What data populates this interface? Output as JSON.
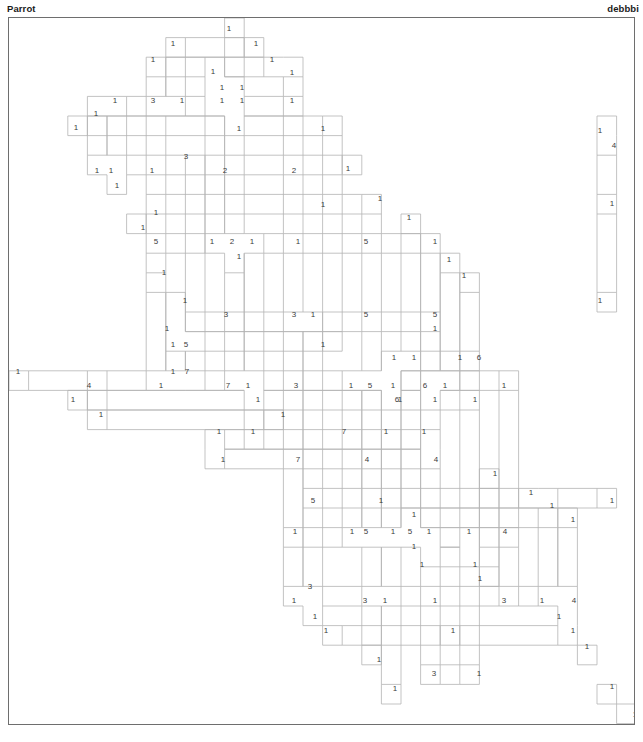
{
  "header": {
    "title": "Parrot",
    "author": "debbbi"
  },
  "footer": {
    "text": ""
  },
  "grid": {
    "cell_size": 19.6,
    "origin_x": 0.5,
    "origin_y": 0.5,
    "cols": 32,
    "rows": 36,
    "border_color": "#6e6e6e",
    "region_color": "#b4b4b4",
    "number_color": "#3c3c3c",
    "background": "#ffffff"
  },
  "chart_data": {
    "type": "table",
    "title": "Parrot",
    "xlabel": "",
    "ylabel": "",
    "clues": [
      {
        "n": "1",
        "x": 228,
        "y": 28
      },
      {
        "n": "1",
        "x": 172,
        "y": 43
      },
      {
        "n": "1",
        "x": 255,
        "y": 43
      },
      {
        "n": "1",
        "x": 152,
        "y": 59
      },
      {
        "n": "1",
        "x": 271,
        "y": 59
      },
      {
        "n": "1",
        "x": 212,
        "y": 71
      },
      {
        "n": "1",
        "x": 291,
        "y": 72
      },
      {
        "n": "1",
        "x": 114,
        "y": 100
      },
      {
        "n": "3",
        "x": 152,
        "y": 100
      },
      {
        "n": "1",
        "x": 181,
        "y": 100
      },
      {
        "n": "1",
        "x": 221,
        "y": 87
      },
      {
        "n": "1",
        "x": 241,
        "y": 87
      },
      {
        "n": "1",
        "x": 221,
        "y": 100
      },
      {
        "n": "1",
        "x": 241,
        "y": 100
      },
      {
        "n": "1",
        "x": 291,
        "y": 100
      },
      {
        "n": "1",
        "x": 95,
        "y": 113
      },
      {
        "n": "1",
        "x": 75,
        "y": 127
      },
      {
        "n": "1",
        "x": 238,
        "y": 128
      },
      {
        "n": "1",
        "x": 322,
        "y": 128
      },
      {
        "n": "1",
        "x": 96,
        "y": 170
      },
      {
        "n": "3",
        "x": 185,
        "y": 156
      },
      {
        "n": "1",
        "x": 151,
        "y": 170
      },
      {
        "n": "2",
        "x": 224,
        "y": 170
      },
      {
        "n": "2",
        "x": 293,
        "y": 170
      },
      {
        "n": "1",
        "x": 347,
        "y": 168
      },
      {
        "n": "1",
        "x": 110,
        "y": 170
      },
      {
        "n": "1",
        "x": 116,
        "y": 185
      },
      {
        "n": "1",
        "x": 155,
        "y": 212
      },
      {
        "n": "1",
        "x": 322,
        "y": 204
      },
      {
        "n": "1",
        "x": 379,
        "y": 198
      },
      {
        "n": "1",
        "x": 142,
        "y": 227
      },
      {
        "n": "5",
        "x": 155,
        "y": 241
      },
      {
        "n": "1",
        "x": 211,
        "y": 241
      },
      {
        "n": "2",
        "x": 231,
        "y": 241
      },
      {
        "n": "1",
        "x": 251,
        "y": 241
      },
      {
        "n": "1",
        "x": 297,
        "y": 241
      },
      {
        "n": "5",
        "x": 365,
        "y": 241
      },
      {
        "n": "1",
        "x": 408,
        "y": 217
      },
      {
        "n": "1",
        "x": 434,
        "y": 241
      },
      {
        "n": "1",
        "x": 238,
        "y": 256
      },
      {
        "n": "1",
        "x": 163,
        "y": 272
      },
      {
        "n": "1",
        "x": 448,
        "y": 259
      },
      {
        "n": "1",
        "x": 463,
        "y": 275
      },
      {
        "n": "1",
        "x": 184,
        "y": 300
      },
      {
        "n": "1",
        "x": 599,
        "y": 130
      },
      {
        "n": "4",
        "x": 613,
        "y": 145
      },
      {
        "n": "1",
        "x": 611,
        "y": 203
      },
      {
        "n": "1",
        "x": 599,
        "y": 300
      },
      {
        "n": "3",
        "x": 225,
        "y": 314
      },
      {
        "n": "3",
        "x": 293,
        "y": 314
      },
      {
        "n": "1",
        "x": 312,
        "y": 314
      },
      {
        "n": "5",
        "x": 365,
        "y": 314
      },
      {
        "n": "5",
        "x": 434,
        "y": 314
      },
      {
        "n": "1",
        "x": 434,
        "y": 328
      },
      {
        "n": "1",
        "x": 166,
        "y": 328
      },
      {
        "n": "1",
        "x": 172,
        "y": 344
      },
      {
        "n": "5",
        "x": 185,
        "y": 344
      },
      {
        "n": "1",
        "x": 322,
        "y": 344
      },
      {
        "n": "1",
        "x": 393,
        "y": 357
      },
      {
        "n": "1",
        "x": 413,
        "y": 357
      },
      {
        "n": "1",
        "x": 459,
        "y": 357
      },
      {
        "n": "6",
        "x": 478,
        "y": 357
      },
      {
        "n": "1",
        "x": 17,
        "y": 371
      },
      {
        "n": "4",
        "x": 88,
        "y": 385
      },
      {
        "n": "1",
        "x": 160,
        "y": 385
      },
      {
        "n": "7",
        "x": 186,
        "y": 371
      },
      {
        "n": "1",
        "x": 172,
        "y": 371
      },
      {
        "n": "7",
        "x": 227,
        "y": 385
      },
      {
        "n": "1",
        "x": 247,
        "y": 385
      },
      {
        "n": "3",
        "x": 295,
        "y": 385
      },
      {
        "n": "1",
        "x": 350,
        "y": 385
      },
      {
        "n": "5",
        "x": 369,
        "y": 385
      },
      {
        "n": "1",
        "x": 392,
        "y": 385
      },
      {
        "n": "6",
        "x": 424,
        "y": 385
      },
      {
        "n": "1",
        "x": 444,
        "y": 385
      },
      {
        "n": "1",
        "x": 503,
        "y": 385
      },
      {
        "n": "1",
        "x": 72,
        "y": 399
      },
      {
        "n": "1",
        "x": 257,
        "y": 399
      },
      {
        "n": "1",
        "x": 399,
        "y": 399
      },
      {
        "n": "6",
        "x": 396,
        "y": 399
      },
      {
        "n": "1",
        "x": 434,
        "y": 399
      },
      {
        "n": "1",
        "x": 100,
        "y": 414
      },
      {
        "n": "1",
        "x": 282,
        "y": 414
      },
      {
        "n": "1",
        "x": 474,
        "y": 399
      },
      {
        "n": "1",
        "x": 218,
        "y": 431
      },
      {
        "n": "1",
        "x": 252,
        "y": 431
      },
      {
        "n": "7",
        "x": 343,
        "y": 431
      },
      {
        "n": "1",
        "x": 385,
        "y": 431
      },
      {
        "n": "1",
        "x": 423,
        "y": 431
      },
      {
        "n": "1",
        "x": 222,
        "y": 459
      },
      {
        "n": "7",
        "x": 297,
        "y": 459
      },
      {
        "n": "4",
        "x": 366,
        "y": 459
      },
      {
        "n": "4",
        "x": 435,
        "y": 459
      },
      {
        "n": "1",
        "x": 494,
        "y": 473
      },
      {
        "n": "1",
        "x": 530,
        "y": 492
      },
      {
        "n": "1",
        "x": 551,
        "y": 505
      },
      {
        "n": "1",
        "x": 572,
        "y": 519
      },
      {
        "n": "1",
        "x": 611,
        "y": 500
      },
      {
        "n": "5",
        "x": 312,
        "y": 500
      },
      {
        "n": "1",
        "x": 380,
        "y": 500
      },
      {
        "n": "1",
        "x": 413,
        "y": 514
      },
      {
        "n": "1",
        "x": 294,
        "y": 531
      },
      {
        "n": "1",
        "x": 351,
        "y": 531
      },
      {
        "n": "5",
        "x": 365,
        "y": 531
      },
      {
        "n": "1",
        "x": 392,
        "y": 531
      },
      {
        "n": "5",
        "x": 409,
        "y": 531
      },
      {
        "n": "1",
        "x": 428,
        "y": 531
      },
      {
        "n": "1",
        "x": 468,
        "y": 531
      },
      {
        "n": "4",
        "x": 504,
        "y": 531
      },
      {
        "n": "1",
        "x": 413,
        "y": 546
      },
      {
        "n": "1",
        "x": 421,
        "y": 564
      },
      {
        "n": "1",
        "x": 474,
        "y": 564
      },
      {
        "n": "3",
        "x": 309,
        "y": 586
      },
      {
        "n": "1",
        "x": 479,
        "y": 578
      },
      {
        "n": "1",
        "x": 293,
        "y": 600
      },
      {
        "n": "3",
        "x": 364,
        "y": 600
      },
      {
        "n": "1",
        "x": 384,
        "y": 600
      },
      {
        "n": "1",
        "x": 434,
        "y": 600
      },
      {
        "n": "3",
        "x": 503,
        "y": 600
      },
      {
        "n": "1",
        "x": 541,
        "y": 600
      },
      {
        "n": "4",
        "x": 573,
        "y": 600
      },
      {
        "n": "1",
        "x": 314,
        "y": 616
      },
      {
        "n": "1",
        "x": 558,
        "y": 616
      },
      {
        "n": "1",
        "x": 325,
        "y": 630
      },
      {
        "n": "1",
        "x": 572,
        "y": 630
      },
      {
        "n": "1",
        "x": 452,
        "y": 630
      },
      {
        "n": "1",
        "x": 586,
        "y": 646
      },
      {
        "n": "1",
        "x": 378,
        "y": 659
      },
      {
        "n": "3",
        "x": 433,
        "y": 673
      },
      {
        "n": "1",
        "x": 478,
        "y": 673
      },
      {
        "n": "1",
        "x": 611,
        "y": 686
      },
      {
        "n": "1",
        "x": 394,
        "y": 688
      },
      {
        "n": "1",
        "x": 634,
        "y": 714
      }
    ]
  }
}
